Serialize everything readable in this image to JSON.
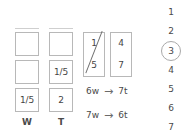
{
  "page": {
    "background_color": "#ffffff",
    "stroke_color": "#b8b8b8",
    "text_color": "#4a4a4a",
    "rule_color": "#cfcfcf"
  },
  "left_grid": {
    "column_headers": [
      "W",
      "T"
    ],
    "rows": [
      {
        "w": "",
        "t": ""
      },
      {
        "w": "",
        "t": "1/5"
      },
      {
        "w": "1/5",
        "t": "2"
      }
    ],
    "cells": [
      {
        "column": "W",
        "row": 1,
        "value": ""
      },
      {
        "column": "T",
        "row": 1,
        "value": ""
      },
      {
        "column": "W",
        "row": 2,
        "value": ""
      },
      {
        "column": "T",
        "row": 2,
        "value": "1/5"
      },
      {
        "column": "W",
        "row": 3,
        "value": "1/5"
      },
      {
        "column": "T",
        "row": 3,
        "value": "2"
      }
    ]
  },
  "fraction_boxes": [
    {
      "numerator": "1",
      "denominator": "5",
      "has_slash": true
    },
    {
      "numerator": "4",
      "denominator": "7",
      "has_slash": false
    }
  ],
  "equations": [
    {
      "left": "6w",
      "arrow": "→",
      "right": "7t"
    },
    {
      "left": "7w",
      "arrow": "→",
      "right": "6t"
    }
  ],
  "number_column": {
    "items": [
      "1",
      "2",
      "3",
      "4",
      "5",
      "6",
      "7"
    ],
    "circled_value": "3",
    "circled_index": 2
  }
}
